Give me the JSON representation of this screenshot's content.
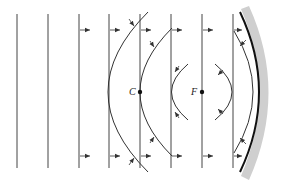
{
  "diagram": {
    "labels": {
      "center": "C",
      "focus": "F"
    },
    "points": {
      "center": {
        "x": 140,
        "y": 92
      },
      "focus": {
        "x": 202,
        "y": 92
      }
    },
    "incident_wavefronts_x": [
      17,
      48,
      79,
      109,
      140,
      171,
      202,
      233
    ],
    "wavefront_top_y": 14,
    "wavefront_bottom_y": 168,
    "mirror": {
      "type": "concave",
      "color": "#111111",
      "shade_color": "#cfcfcf"
    },
    "colors": {
      "line": "#333333",
      "mirror": "#111111",
      "shade": "#cfcfcf"
    }
  }
}
